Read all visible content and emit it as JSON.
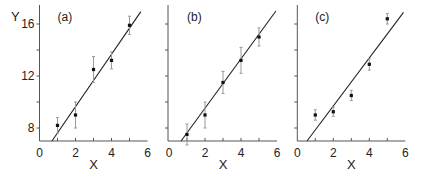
{
  "chart_data": [
    {
      "type": "scatter",
      "panel_label": "(a)",
      "xlabel": "X",
      "ylabel": "Y",
      "xlim": [
        0,
        6
      ],
      "ylim": [
        7,
        17
      ],
      "xticks": [
        0,
        2,
        4,
        6
      ],
      "yticks_labeled": [
        8,
        12,
        16
      ],
      "yticks_minor": [
        8,
        10,
        12,
        14,
        16
      ],
      "xticks_minor": [
        1,
        2,
        3,
        4,
        5
      ],
      "points": [
        {
          "x": 1,
          "y": 8.2,
          "err": 0.6
        },
        {
          "x": 2,
          "y": 9.0,
          "err": 1.0
        },
        {
          "x": 3,
          "y": 12.5,
          "err": 1.0
        },
        {
          "x": 4,
          "y": 13.2,
          "err": 0.65
        },
        {
          "x": 5,
          "y": 15.9,
          "err": 0.7
        }
      ],
      "fit_line": {
        "x0": 0.69,
        "y0": 7.0,
        "x1": 5.63,
        "y1": 16.95
      }
    },
    {
      "type": "scatter",
      "panel_label": "(b)",
      "xlabel": "X",
      "ylabel": "",
      "xlim": [
        0,
        6
      ],
      "ylim": [
        7,
        17
      ],
      "xticks": [
        0,
        2,
        4,
        6
      ],
      "yticks_labeled": [],
      "yticks_minor": [
        8,
        10,
        12,
        14,
        16
      ],
      "xticks_minor": [
        1,
        2,
        3,
        4,
        5
      ],
      "points": [
        {
          "x": 1,
          "y": 7.5,
          "err": 0.8
        },
        {
          "x": 2,
          "y": 9.0,
          "err": 1.0
        },
        {
          "x": 3,
          "y": 11.5,
          "err": 0.85
        },
        {
          "x": 4,
          "y": 13.2,
          "err": 1.0
        },
        {
          "x": 5,
          "y": 15.0,
          "err": 0.7
        }
      ],
      "fit_line": {
        "x0": 0.67,
        "y0": 7.0,
        "x1": 5.94,
        "y1": 17.0
      }
    },
    {
      "type": "scatter",
      "panel_label": "(c)",
      "xlabel": "X",
      "ylabel": "",
      "xlim": [
        0,
        6
      ],
      "ylim": [
        7,
        17
      ],
      "xticks": [
        0,
        2,
        4,
        6
      ],
      "yticks_labeled": [],
      "yticks_minor": [
        8,
        10,
        12,
        14,
        16
      ],
      "xticks_minor": [
        1,
        2,
        3,
        4,
        5
      ],
      "points": [
        {
          "x": 1,
          "y": 9.0,
          "err": 0.4
        },
        {
          "x": 2,
          "y": 9.25,
          "err": 0.35
        },
        {
          "x": 3,
          "y": 10.5,
          "err": 0.4
        },
        {
          "x": 4,
          "y": 12.9,
          "err": 0.45
        },
        {
          "x": 5,
          "y": 16.4,
          "err": 0.4
        }
      ],
      "fit_line": {
        "x0": 0.54,
        "y0": 7.0,
        "x1": 5.9,
        "y1": 16.9
      }
    }
  ],
  "layout": {
    "panels": [
      {
        "x_origin_px": 39.5,
        "axis_x_px": 39.5
      },
      {
        "x_origin_px": 169,
        "axis_x_px": 168
      },
      {
        "x_origin_px": 297.3,
        "axis_x_px": 297.3
      }
    ],
    "px_per_x": 18,
    "px_per_y": 13,
    "y_ref_value": 16,
    "y_ref_px": 24,
    "axis_top_px": 5
  },
  "colors": {
    "axis": "#555555",
    "line": "#222222",
    "marker": "#111111",
    "errorbar": "#9a9a9a"
  }
}
